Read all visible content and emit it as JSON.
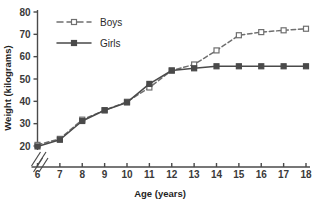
{
  "chart_data": {
    "type": "line",
    "title": "",
    "xlabel": "Age (years)",
    "ylabel": "Weight (kilograms)",
    "x": [
      6,
      7,
      8,
      9,
      10,
      11,
      12,
      13,
      14,
      15,
      16,
      17,
      18
    ],
    "xlim": [
      6,
      18
    ],
    "ylim": [
      20,
      80
    ],
    "yticks": [
      20,
      30,
      40,
      50,
      60,
      70,
      80
    ],
    "xticks": [
      6,
      7,
      8,
      9,
      10,
      11,
      12,
      13,
      14,
      15,
      16,
      17,
      18
    ],
    "ytick_labels": [
      "20",
      "30",
      "40",
      "50",
      "60",
      "70",
      "80"
    ],
    "xtick_labels": [
      "6",
      "7",
      "8",
      "9",
      "10",
      "11",
      "12",
      "13",
      "14",
      "15",
      "16",
      "17",
      "18"
    ],
    "grid": false,
    "axis_break": true,
    "legend_position": "top-left",
    "series": [
      {
        "name": "Boys",
        "values": [
          20.5,
          23.2,
          31.8,
          36.0,
          39.8,
          46.2,
          53.8,
          56.5,
          62.8,
          69.6,
          71.0,
          71.8,
          72.5
        ],
        "line_style": "dashed",
        "marker": "open-square",
        "color": "#6f6f6f"
      },
      {
        "name": "Girls",
        "values": [
          19.8,
          22.8,
          31.2,
          36.0,
          39.5,
          47.8,
          53.8,
          54.8,
          55.7,
          55.7,
          55.7,
          55.7,
          55.7
        ],
        "line_style": "solid",
        "marker": "filled-square",
        "color": "#4a4a4a"
      }
    ]
  },
  "legend": {
    "items": [
      {
        "label": "Boys"
      },
      {
        "label": "Girls"
      }
    ]
  },
  "axes": {
    "x_title": "Age (years)",
    "y_title": "Weight (kilograms)"
  },
  "colors": {
    "boys": "#6f6f6f",
    "girls": "#4a4a4a",
    "axis": "#4a4a4a",
    "text": "#2b2b2b",
    "background": "#ffffff"
  }
}
